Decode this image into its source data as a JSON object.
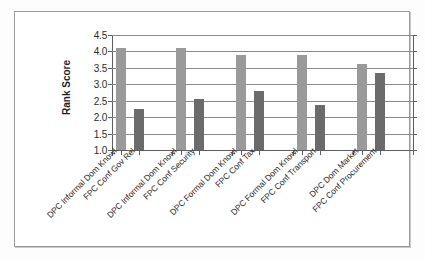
{
  "chart_data": {
    "type": "bar",
    "title": "",
    "subtitle": "",
    "xlabel": "",
    "ylabel": "Rank Score",
    "ylim": [
      1.0,
      4.5
    ],
    "ytick_labels": [
      "4.5",
      "4.0",
      "3.5",
      "3.0",
      "2.5",
      "2.0",
      "1.5",
      "1.0"
    ],
    "ytick_values": [
      4.5,
      4.0,
      3.5,
      3.0,
      2.5,
      2.0,
      1.5,
      1.0
    ],
    "grid": true,
    "legend": "none",
    "categories": [
      "DPC Informal Dom Knowl",
      "FPC Conf Gov Rel",
      "DPC Informal Dom Knowl",
      "FPC Conf Security",
      "DPC Formal Dom Knowl",
      "FPC Conf Tax",
      "DPC Formal Dom Knowl",
      "FPC Conf Transport",
      "DPC Dom Market",
      "FPC Conf Procurement"
    ],
    "values": [
      4.1,
      2.25,
      4.1,
      2.55,
      3.9,
      2.8,
      3.88,
      2.38,
      3.62,
      3.35
    ],
    "bar_styles": [
      "light",
      "dark",
      "light",
      "dark",
      "light",
      "dark",
      "light",
      "dark",
      "light",
      "dark"
    ],
    "colors": {
      "light_bar": "#9a9a9a",
      "dark_bar": "#6b6b6b",
      "grid": "#8a8a8a",
      "axis": "#5e5e5e",
      "frame": "#9b9b9b",
      "background": "#ffffff",
      "text": "#2b2b2b"
    }
  }
}
